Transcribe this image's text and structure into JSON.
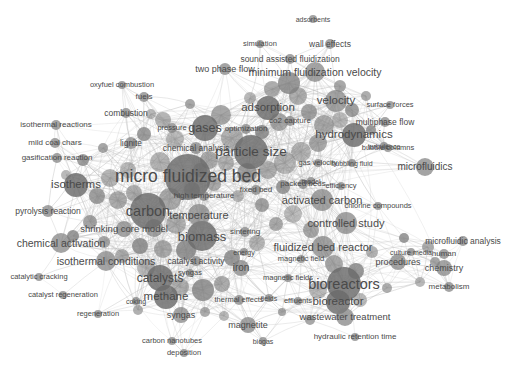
{
  "view": {
    "title": "bibliometric co-occurrence network map",
    "width": 518,
    "height": 371,
    "background_color": "#ffffff",
    "node_color": "#7d7d7d",
    "node_color_dark": "#6a6a6a",
    "edge_color": "#b9b9b9",
    "label_color": "#4a4a4a",
    "style": "grayscale-density-network"
  },
  "chart_data": {
    "type": "scatter",
    "title": "",
    "xlabel": "",
    "ylabel": "",
    "xlim": [
      0,
      518
    ],
    "ylim": [
      0,
      371
    ],
    "grid": false,
    "legend": "none",
    "nodes": [
      {
        "label": "micro fluidized bed",
        "x": 188,
        "y": 177,
        "r": 23,
        "fs": 17.5
      },
      {
        "label": "particle size",
        "x": 251,
        "y": 152,
        "r": 17,
        "fs": 13.5
      },
      {
        "label": "carbon",
        "x": 148,
        "y": 211,
        "r": 18,
        "fs": 14.5
      },
      {
        "label": "bioreactors",
        "x": 344,
        "y": 284,
        "r": 17,
        "fs": 14.5
      },
      {
        "label": "biomass",
        "x": 202,
        "y": 236,
        "r": 15,
        "fs": 13
      },
      {
        "label": "gases",
        "x": 205,
        "y": 128,
        "r": 13,
        "fs": 12.5
      },
      {
        "label": "adsorption",
        "x": 268,
        "y": 108,
        "r": 12,
        "fs": 11.5
      },
      {
        "label": "hydrodynamics",
        "x": 354,
        "y": 135,
        "r": 12,
        "fs": 11.5
      },
      {
        "label": "isotherms",
        "x": 76,
        "y": 185,
        "r": 12,
        "fs": 11.5
      },
      {
        "label": "catalysts",
        "x": 160,
        "y": 278,
        "r": 13,
        "fs": 12
      },
      {
        "label": "methane",
        "x": 166,
        "y": 297,
        "r": 12,
        "fs": 11.5
      },
      {
        "label": "temperature",
        "x": 199,
        "y": 215,
        "r": 11,
        "fs": 11
      },
      {
        "label": "velocity",
        "x": 336,
        "y": 101,
        "r": 11,
        "fs": 11.5
      },
      {
        "label": "minimum fluidization velocity",
        "x": 315,
        "y": 72,
        "r": 10,
        "fs": 10.5
      },
      {
        "label": "bioreactor",
        "x": 338,
        "y": 302,
        "r": 12,
        "fs": 11.5
      },
      {
        "label": "activated carbon",
        "x": 322,
        "y": 200,
        "r": 11,
        "fs": 11
      },
      {
        "label": "controlled study",
        "x": 346,
        "y": 223,
        "r": 11,
        "fs": 11
      },
      {
        "label": "fluidized bed reactor",
        "x": 323,
        "y": 247,
        "r": 11,
        "fs": 11
      },
      {
        "label": "chemical activation",
        "x": 61,
        "y": 243,
        "r": 10,
        "fs": 10.5
      },
      {
        "label": "isothermal conditions",
        "x": 106,
        "y": 261,
        "r": 10,
        "fs": 10.5
      },
      {
        "label": "microfluidics",
        "x": 425,
        "y": 167,
        "r": 9,
        "fs": 10
      },
      {
        "label": "wastewater treatment",
        "x": 345,
        "y": 317,
        "r": 9,
        "fs": 9.5
      },
      {
        "label": "shrinking core model",
        "x": 124,
        "y": 229,
        "r": 8,
        "fs": 9.5
      },
      {
        "label": "procedures",
        "x": 398,
        "y": 262,
        "r": 8,
        "fs": 9
      },
      {
        "label": "chemistry",
        "x": 444,
        "y": 268,
        "r": 8,
        "fs": 9
      },
      {
        "label": "syngas",
        "x": 181,
        "y": 315,
        "r": 8,
        "fs": 9
      },
      {
        "label": "iron",
        "x": 241,
        "y": 268,
        "r": 8,
        "fs": 10
      },
      {
        "label": "magnetite",
        "x": 248,
        "y": 325,
        "r": 8,
        "fs": 9
      },
      {
        "label": "pyrolysis reaction",
        "x": 48,
        "y": 211,
        "r": 6,
        "fs": 8.5
      },
      {
        "label": "combustion",
        "x": 126,
        "y": 113,
        "r": 5,
        "fs": 8.5
      },
      {
        "label": "isothermal reactions",
        "x": 56,
        "y": 125,
        "r": 5,
        "fs": 8
      },
      {
        "label": "gasification reaction",
        "x": 57,
        "y": 158,
        "r": 5,
        "fs": 8
      },
      {
        "label": "mild coal chars",
        "x": 55,
        "y": 143,
        "r": 5,
        "fs": 8
      },
      {
        "label": "lignite",
        "x": 131,
        "y": 143,
        "r": 6,
        "fs": 8.5
      },
      {
        "label": "chemical analysis",
        "x": 196,
        "y": 148,
        "r": 6,
        "fs": 8.5
      },
      {
        "label": "pressure",
        "x": 172,
        "y": 128,
        "r": 5,
        "fs": 7.5
      },
      {
        "label": "optimization",
        "x": 246,
        "y": 129,
        "r": 5,
        "fs": 8
      },
      {
        "label": "co2 capture",
        "x": 290,
        "y": 121,
        "r": 5,
        "fs": 8
      },
      {
        "label": "two phase flow",
        "x": 225,
        "y": 69,
        "r": 6,
        "fs": 9
      },
      {
        "label": "oxyfuel combustion",
        "x": 122,
        "y": 85,
        "r": 4,
        "fs": 7.5
      },
      {
        "label": "fuels",
        "x": 144,
        "y": 97,
        "r": 5,
        "fs": 8
      },
      {
        "label": "simulation",
        "x": 260,
        "y": 44,
        "r": 4,
        "fs": 7.5
      },
      {
        "label": "wall effects",
        "x": 330,
        "y": 44,
        "r": 5,
        "fs": 8.5
      },
      {
        "label": "adsorbents",
        "x": 313,
        "y": 19,
        "r": 4,
        "fs": 7
      },
      {
        "label": "sound assisted fluidization",
        "x": 290,
        "y": 59,
        "r": 5,
        "fs": 8.5
      },
      {
        "label": "surface forces",
        "x": 390,
        "y": 105,
        "r": 4,
        "fs": 7.5
      },
      {
        "label": "multiphase flow",
        "x": 385,
        "y": 122,
        "r": 5,
        "fs": 8.5
      },
      {
        "label": "bubble columns",
        "x": 388,
        "y": 148,
        "r": 4,
        "fs": 7.5
      },
      {
        "label": "turbulence",
        "x": 384,
        "y": 146,
        "r": 4,
        "fs": 7
      },
      {
        "label": "gas velocity",
        "x": 318,
        "y": 163,
        "r": 4,
        "fs": 7.5
      },
      {
        "label": "bubbling fluid",
        "x": 352,
        "y": 163,
        "r": 4,
        "fs": 7
      },
      {
        "label": "model",
        "x": 311,
        "y": 181,
        "r": 4,
        "fs": 7
      },
      {
        "label": "fixed bed",
        "x": 256,
        "y": 190,
        "r": 5,
        "fs": 8
      },
      {
        "label": "packed beds",
        "x": 303,
        "y": 184,
        "r": 5,
        "fs": 8
      },
      {
        "label": "efficiency",
        "x": 341,
        "y": 186,
        "r": 4,
        "fs": 7.5
      },
      {
        "label": "high temperature",
        "x": 204,
        "y": 196,
        "r": 5,
        "fs": 8
      },
      {
        "label": "sintering",
        "x": 245,
        "y": 232,
        "r": 5,
        "fs": 8
      },
      {
        "label": "energy",
        "x": 244,
        "y": 252,
        "r": 4,
        "fs": 7
      },
      {
        "label": "catalyst activity",
        "x": 196,
        "y": 261,
        "r": 5,
        "fs": 8.5
      },
      {
        "label": "syngas ",
        "x": 190,
        "y": 273,
        "r": 4,
        "fs": 7.5
      },
      {
        "label": "chlorine compounds",
        "x": 378,
        "y": 206,
        "r": 4,
        "fs": 7.5
      },
      {
        "label": "microfluidic analysis",
        "x": 463,
        "y": 241,
        "r": 5,
        "fs": 8.5
      },
      {
        "label": "human",
        "x": 444,
        "y": 254,
        "r": 5,
        "fs": 8
      },
      {
        "label": "metabolism",
        "x": 449,
        "y": 287,
        "r": 5,
        "fs": 8
      },
      {
        "label": "culture media",
        "x": 411,
        "y": 252,
        "r": 4,
        "fs": 7
      },
      {
        "label": "magnetic field",
        "x": 301,
        "y": 259,
        "r": 4,
        "fs": 7.5
      },
      {
        "label": "magnetic fields",
        "x": 288,
        "y": 278,
        "r": 4,
        "fs": 7.5
      },
      {
        "label": "hydraulic retention time",
        "x": 355,
        "y": 337,
        "r": 4,
        "fs": 8
      },
      {
        "label": "thermal effects",
        "x": 239,
        "y": 300,
        "r": 5,
        "fs": 7.5
      },
      {
        "label": "effluents",
        "x": 298,
        "y": 301,
        "r": 4,
        "fs": 7.5
      },
      {
        "label": "fields",
        "x": 269,
        "y": 298,
        "r": 4,
        "fs": 7
      },
      {
        "label": "biogas",
        "x": 263,
        "y": 341,
        "r": 4,
        "fs": 7
      },
      {
        "label": "coking",
        "x": 136,
        "y": 301,
        "r": 4,
        "fs": 7
      },
      {
        "label": "carbon nanotubes",
        "x": 172,
        "y": 341,
        "r": 4,
        "fs": 7.5
      },
      {
        "label": "deposition",
        "x": 184,
        "y": 353,
        "r": 4,
        "fs": 7.5
      },
      {
        "label": "catalytic cracking",
        "x": 39,
        "y": 277,
        "r": 4,
        "fs": 7.5
      },
      {
        "label": "catalyst regeneration",
        "x": 63,
        "y": 295,
        "r": 4,
        "fs": 7.5
      },
      {
        "label": "regeneration",
        "x": 98,
        "y": 314,
        "r": 4,
        "fs": 7.5
      }
    ],
    "ghost_nodes": [
      {
        "x": 163,
        "y": 120,
        "r": 8
      },
      {
        "x": 175,
        "y": 139,
        "r": 9
      },
      {
        "x": 144,
        "y": 134,
        "r": 7
      },
      {
        "x": 221,
        "y": 115,
        "r": 10
      },
      {
        "x": 232,
        "y": 138,
        "r": 11
      },
      {
        "x": 262,
        "y": 132,
        "r": 7
      },
      {
        "x": 279,
        "y": 122,
        "r": 9
      },
      {
        "x": 298,
        "y": 96,
        "r": 9
      },
      {
        "x": 289,
        "y": 83,
        "r": 11
      },
      {
        "x": 272,
        "y": 89,
        "r": 8
      },
      {
        "x": 309,
        "y": 112,
        "r": 8
      },
      {
        "x": 324,
        "y": 125,
        "r": 10
      },
      {
        "x": 340,
        "y": 120,
        "r": 8
      },
      {
        "x": 352,
        "y": 110,
        "r": 7
      },
      {
        "x": 318,
        "y": 143,
        "r": 9
      },
      {
        "x": 301,
        "y": 152,
        "r": 10
      },
      {
        "x": 285,
        "y": 163,
        "r": 11
      },
      {
        "x": 268,
        "y": 170,
        "r": 9
      },
      {
        "x": 247,
        "y": 173,
        "r": 10
      },
      {
        "x": 226,
        "y": 163,
        "r": 8
      },
      {
        "x": 209,
        "y": 160,
        "r": 9
      },
      {
        "x": 160,
        "y": 162,
        "r": 10
      },
      {
        "x": 128,
        "y": 170,
        "r": 8
      },
      {
        "x": 110,
        "y": 178,
        "r": 9
      },
      {
        "x": 97,
        "y": 196,
        "r": 8
      },
      {
        "x": 118,
        "y": 200,
        "r": 9
      },
      {
        "x": 134,
        "y": 193,
        "r": 8
      },
      {
        "x": 170,
        "y": 199,
        "r": 11
      },
      {
        "x": 192,
        "y": 190,
        "r": 8
      },
      {
        "x": 214,
        "y": 184,
        "r": 7
      },
      {
        "x": 154,
        "y": 228,
        "r": 9
      },
      {
        "x": 176,
        "y": 224,
        "r": 10
      },
      {
        "x": 186,
        "y": 250,
        "r": 10
      },
      {
        "x": 163,
        "y": 249,
        "r": 9
      },
      {
        "x": 140,
        "y": 246,
        "r": 8
      },
      {
        "x": 122,
        "y": 256,
        "r": 7
      },
      {
        "x": 146,
        "y": 268,
        "r": 9
      },
      {
        "x": 180,
        "y": 287,
        "r": 9
      },
      {
        "x": 203,
        "y": 290,
        "r": 11
      },
      {
        "x": 222,
        "y": 284,
        "r": 8
      },
      {
        "x": 232,
        "y": 258,
        "r": 8
      },
      {
        "x": 257,
        "y": 243,
        "r": 8
      },
      {
        "x": 276,
        "y": 224,
        "r": 7
      },
      {
        "x": 293,
        "y": 214,
        "r": 9
      },
      {
        "x": 311,
        "y": 230,
        "r": 8
      },
      {
        "x": 334,
        "y": 264,
        "r": 9
      },
      {
        "x": 356,
        "y": 271,
        "r": 8
      },
      {
        "x": 318,
        "y": 290,
        "r": 9
      },
      {
        "x": 360,
        "y": 300,
        "r": 7
      },
      {
        "x": 372,
        "y": 252,
        "r": 6
      },
      {
        "x": 283,
        "y": 187,
        "r": 7
      },
      {
        "x": 262,
        "y": 205,
        "r": 7
      },
      {
        "x": 238,
        "y": 196,
        "r": 6
      },
      {
        "x": 200,
        "y": 170,
        "r": 7
      },
      {
        "x": 90,
        "y": 222,
        "r": 7
      },
      {
        "x": 73,
        "y": 236,
        "r": 6
      },
      {
        "x": 104,
        "y": 242,
        "r": 6
      },
      {
        "x": 138,
        "y": 310,
        "r": 5
      },
      {
        "x": 205,
        "y": 312,
        "r": 5
      },
      {
        "x": 224,
        "y": 316,
        "r": 5
      },
      {
        "x": 151,
        "y": 114,
        "r": 5
      },
      {
        "x": 190,
        "y": 104,
        "r": 5
      },
      {
        "x": 250,
        "y": 98,
        "r": 6
      },
      {
        "x": 340,
        "y": 86,
        "r": 6
      },
      {
        "x": 366,
        "y": 96,
        "r": 5
      },
      {
        "x": 371,
        "y": 130,
        "r": 5
      },
      {
        "x": 404,
        "y": 238,
        "r": 5
      },
      {
        "x": 428,
        "y": 247,
        "r": 6
      },
      {
        "x": 435,
        "y": 262,
        "r": 5
      },
      {
        "x": 420,
        "y": 282,
        "r": 5
      },
      {
        "x": 387,
        "y": 288,
        "r": 5
      },
      {
        "x": 310,
        "y": 320,
        "r": 5
      },
      {
        "x": 282,
        "y": 312,
        "r": 4
      },
      {
        "x": 83,
        "y": 160,
        "r": 6
      },
      {
        "x": 66,
        "y": 175,
        "r": 5
      },
      {
        "x": 103,
        "y": 148,
        "r": 5
      }
    ]
  }
}
